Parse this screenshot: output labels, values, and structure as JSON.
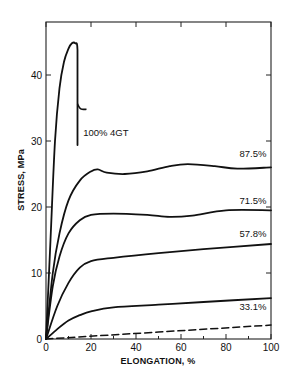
{
  "chart_data": {
    "type": "line",
    "title": "",
    "xlabel": "ELONGATION, %",
    "ylabel": "STRESS, MPa",
    "xlim": [
      0,
      100
    ],
    "ylim": [
      0,
      48
    ],
    "x_ticks": [
      0,
      20,
      40,
      60,
      80,
      100
    ],
    "x_minor_ticks": [
      10,
      30,
      50,
      70,
      90
    ],
    "y_ticks": [
      0,
      10,
      20,
      30,
      40
    ],
    "y_minor_ticks": [],
    "grid": false,
    "legend": "inline labels",
    "series": [
      {
        "name": "100% 4GT",
        "style": "solid",
        "label_pos": [
          16.5,
          30.8
        ],
        "points": [
          [
            0,
            0
          ],
          [
            2,
            15
          ],
          [
            4,
            30
          ],
          [
            6,
            38
          ],
          [
            8,
            42
          ],
          [
            10,
            44
          ],
          [
            11.5,
            44.8
          ],
          [
            13,
            44.8
          ],
          [
            14,
            43.8
          ],
          [
            14,
            35.5
          ],
          [
            14,
            29.4
          ]
        ],
        "hook": [
          [
            14,
            35.6
          ],
          [
            15,
            35
          ],
          [
            16,
            34.8
          ],
          [
            18,
            34.8
          ]
        ]
      },
      {
        "name": "87.5%",
        "style": "solid",
        "label_pos": [
          86,
          27.6
        ],
        "points": [
          [
            0,
            0
          ],
          [
            3,
            10
          ],
          [
            6,
            16
          ],
          [
            10,
            21
          ],
          [
            15,
            24
          ],
          [
            20,
            25.4
          ],
          [
            23,
            25.7
          ],
          [
            27,
            25.2
          ],
          [
            35,
            25
          ],
          [
            45,
            25.4
          ],
          [
            55,
            26.2
          ],
          [
            63,
            26.5
          ],
          [
            75,
            26.2
          ],
          [
            85,
            25.8
          ],
          [
            100,
            26
          ]
        ]
      },
      {
        "name": "71.5%",
        "style": "solid",
        "label_pos": [
          86,
          20.5
        ],
        "points": [
          [
            0,
            0
          ],
          [
            3,
            8
          ],
          [
            6,
            12.5
          ],
          [
            10,
            16
          ],
          [
            15,
            18
          ],
          [
            20,
            18.8
          ],
          [
            30,
            19
          ],
          [
            45,
            18.8
          ],
          [
            55,
            18.5
          ],
          [
            65,
            18.7
          ],
          [
            80,
            19.5
          ],
          [
            100,
            19.5
          ]
        ]
      },
      {
        "name": "57.8%",
        "style": "solid",
        "label_pos": [
          86,
          15.5
        ],
        "points": [
          [
            0,
            0
          ],
          [
            5,
            5
          ],
          [
            10,
            8.5
          ],
          [
            15,
            10.8
          ],
          [
            20,
            11.8
          ],
          [
            30,
            12.3
          ],
          [
            50,
            13
          ],
          [
            70,
            13.6
          ],
          [
            100,
            14.4
          ]
        ]
      },
      {
        "name": "33.1%",
        "style": "solid",
        "label_pos": [
          86,
          4.4
        ],
        "points": [
          [
            0,
            0
          ],
          [
            5,
            1.5
          ],
          [
            10,
            2.8
          ],
          [
            15,
            3.6
          ],
          [
            20,
            4.2
          ],
          [
            30,
            4.8
          ],
          [
            50,
            5.2
          ],
          [
            70,
            5.6
          ],
          [
            100,
            6.2
          ]
        ]
      },
      {
        "name": "",
        "style": "dashed",
        "points": [
          [
            0,
            0
          ],
          [
            100,
            2.1
          ]
        ]
      }
    ]
  },
  "axes": {
    "x_title": "ELONGATION, %",
    "y_title": "STRESS, MPa"
  }
}
